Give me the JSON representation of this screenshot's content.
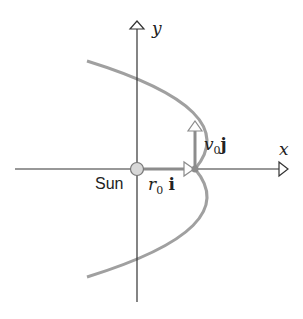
{
  "labels": {
    "y_axis": "y",
    "x_axis": "x",
    "sun": "Sun",
    "position_vector": "r",
    "position_sub": "0",
    "position_unit": "i",
    "velocity_vector": "v",
    "velocity_sub": "0",
    "velocity_unit": "j"
  },
  "colors": {
    "axis": "#333333",
    "orbit": "#a0a0a0",
    "sun_fill": "#d8d8d8",
    "vector": "#8c8c8c"
  }
}
